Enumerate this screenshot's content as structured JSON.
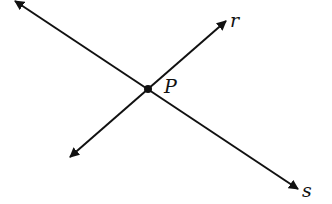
{
  "diagram": {
    "type": "intersecting-lines",
    "colors": {
      "stroke": "#111111",
      "background": "#ffffff"
    },
    "point": {
      "label": "P",
      "x": 148,
      "y": 89
    },
    "lines": [
      {
        "name": "s",
        "label": "s",
        "from": [
          15,
          1
        ],
        "to": [
          298,
          189
        ],
        "label_pos": [
          302,
          197
        ]
      },
      {
        "name": "r",
        "label": "r",
        "from": [
          70,
          157
        ],
        "to": [
          226,
          21
        ],
        "label_pos": [
          230,
          27
        ]
      }
    ],
    "point_label_pos": [
      164,
      93
    ]
  }
}
